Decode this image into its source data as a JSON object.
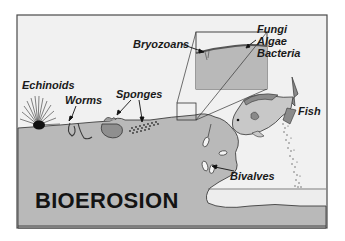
{
  "title": "BIOEROSION",
  "labels": {
    "echinoids": "Echinoids",
    "worms": "Worms",
    "sponges": "Sponges",
    "bryozoans": "Bryozoans",
    "fungi": "Fungi",
    "algae": "Algae",
    "bacteria": "Bacteria",
    "fish": "Fish",
    "bivalves": "Bivalves"
  },
  "colors": {
    "background": "#f1f1f1",
    "substrate": "#b9b9b9",
    "outline": "#3a3a3a",
    "text": "#1a1a1a",
    "fish_body": "#c4c4c4",
    "fish_dark": "#8a8a8a"
  }
}
